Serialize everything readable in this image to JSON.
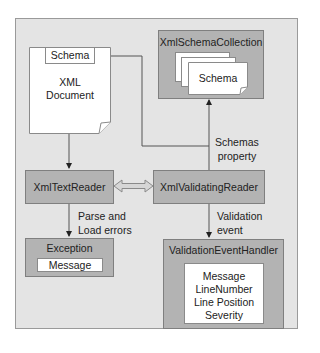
{
  "diagram": {
    "xml_document": {
      "schema_tab": "Schema",
      "title_line1": "XML",
      "title_line2": "Document"
    },
    "schema_collection": {
      "title": "XmlSchemaCollection",
      "schema_label": "Schema"
    },
    "text_reader": {
      "title": "XmlTextReader"
    },
    "validating_reader": {
      "title": "XmlValidatingReader"
    },
    "exception": {
      "title": "Exception",
      "field": "Message"
    },
    "validation_handler": {
      "title": "ValidationEventHandler",
      "fields": [
        "Message",
        "LineNumber",
        "Line Position",
        "Severity"
      ]
    },
    "edges": {
      "schemas_property_line1": "Schemas",
      "schemas_property_line2": "property",
      "parse_errors_line1": "Parse and",
      "parse_errors_line2": "Load errors",
      "validation_event_line1": "Validation",
      "validation_event_line2": "event"
    },
    "colors": {
      "frame_bg": "#e4e4e4",
      "box_fill": "#b3b3b3",
      "line": "#555555"
    }
  }
}
